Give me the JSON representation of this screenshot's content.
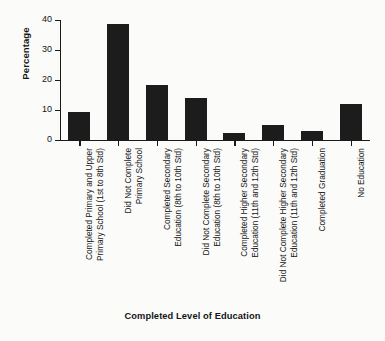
{
  "chart_data": {
    "type": "bar",
    "title": "",
    "xlabel": "Completed Level of Education",
    "ylabel": "Percentage",
    "ylim": [
      0,
      40
    ],
    "yticks": [
      0,
      10,
      20,
      30,
      40
    ],
    "grid": false,
    "legend": null,
    "bar_color": "#1c1c1c",
    "background_color": "#fbfbfa",
    "categories": [
      "Completed Primary and Upper Primary School (1st to 8th Std)",
      "Did Not Complete Primary School",
      "Completed Secondary Education (8th to 10th Std)",
      "Did Not Complete Secondary Education (8th to 10th Std)",
      "Completed Higher Secondary Education (11th and 12th Std)",
      "Did Not Complete Higher Secondary Education (11th and 12th Std)",
      "Completed Graduation",
      "No Education"
    ],
    "category_lines": [
      [
        "Completed Primary and Upper",
        "Primary School (1st to 8th Std)"
      ],
      [
        "Did Not Complete",
        "Primary School"
      ],
      [
        "Completed Secondary",
        "Education (8th to 10th Std)"
      ],
      [
        "Did Not Complete Secondary",
        "Education (8th to 10th Std)"
      ],
      [
        "Completed Higher Secondary",
        "Education (11th and 12th Std)"
      ],
      [
        "Did Not Complete Higher Secondary",
        "Education (11th and 12th Std)"
      ],
      [
        "Completed Graduation",
        ""
      ],
      [
        "No Education",
        ""
      ]
    ],
    "values": [
      9.3,
      38.8,
      18.5,
      14.0,
      2.3,
      5.0,
      2.9,
      12.1
    ]
  }
}
